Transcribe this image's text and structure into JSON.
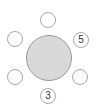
{
  "diagram": {
    "type": "round-table-seating",
    "colors": {
      "table_fill": "#d9d9d9",
      "table_border": "#9a9a9a",
      "seat_fill": "#ffffff",
      "seat_border": "#a8a8a8",
      "label_text": "#333333"
    },
    "table": {
      "label": ""
    },
    "seats": [
      {
        "position": "top",
        "label": ""
      },
      {
        "position": "upper-right",
        "label": "5"
      },
      {
        "position": "lower-right",
        "label": ""
      },
      {
        "position": "bottom",
        "label": "3"
      },
      {
        "position": "lower-left",
        "label": ""
      },
      {
        "position": "upper-left",
        "label": ""
      }
    ]
  }
}
